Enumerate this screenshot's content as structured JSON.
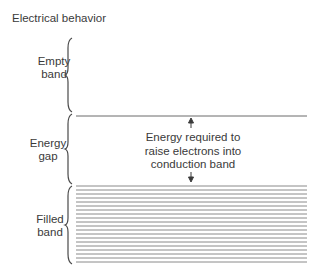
{
  "title": "Electrical behavior",
  "regions": [
    {
      "name": "empty-band",
      "label_line1": "Empty",
      "label_line2": "band"
    },
    {
      "name": "energy-gap",
      "label_line1": "Energy",
      "label_line2": "gap"
    },
    {
      "name": "filled-band",
      "label_line1": "Filled",
      "label_line2": "band"
    }
  ],
  "annotation": {
    "line1": "Energy required to",
    "line2": "raise electrons into",
    "line3": "conduction band"
  },
  "colors": {
    "line": "#8a8a8a",
    "text": "#3a3a3a"
  },
  "filled_band_line_count": 20
}
